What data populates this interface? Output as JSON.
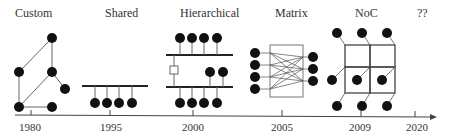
{
  "diagram": {
    "eras": [
      {
        "label": "Custom",
        "year": "1980"
      },
      {
        "label": "Shared",
        "year": "1995"
      },
      {
        "label": "Hierarchical",
        "year": "2000"
      },
      {
        "label": "Matrix",
        "year": "2005"
      },
      {
        "label": "NoC",
        "year": "2009"
      },
      {
        "label": "??",
        "year": "2020"
      }
    ],
    "colors": {
      "node": "#111111",
      "line": "#444444",
      "bus": "#222222",
      "text": "#333333"
    }
  }
}
